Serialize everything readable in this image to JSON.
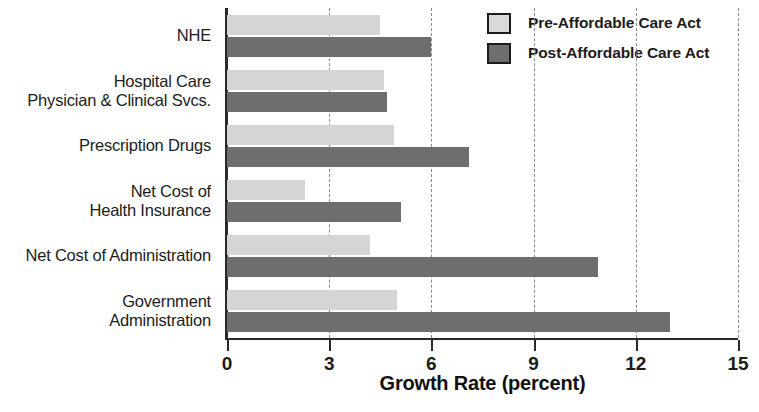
{
  "chart_data": {
    "type": "bar",
    "orientation": "horizontal",
    "title": "",
    "xlabel": "Growth Rate (percent)",
    "ylabel": "",
    "xlim": [
      0,
      15
    ],
    "xticks": [
      0,
      3,
      6,
      9,
      12,
      15
    ],
    "xticklabels": [
      "0",
      "3",
      "6",
      "9",
      "12",
      "15"
    ],
    "grid": "vertical-dashed",
    "legend_position": "top-right",
    "categories": [
      "NHE",
      "Hospital Care\nPhysician & Clinical Svcs.",
      "Prescription Drugs",
      "Net Cost of\nHealth Insurance",
      "Net Cost of Administration",
      "Government\nAdministration"
    ],
    "series": [
      {
        "name": "Pre-Affordable Care Act",
        "color": "#d5d5d5",
        "values": [
          4.5,
          4.6,
          4.9,
          2.3,
          4.2,
          5.0
        ]
      },
      {
        "name": "Post-Affordable Care Act",
        "color": "#6e6e6e",
        "values": [
          6.0,
          4.7,
          7.1,
          5.1,
          10.9,
          13.0
        ]
      }
    ]
  },
  "legend": {
    "items": [
      {
        "label": "Pre-Affordable Care Act",
        "swatch": "pre"
      },
      {
        "label": "Post-Affordable Care Act",
        "swatch": "post"
      }
    ]
  },
  "axis": {
    "x_title": "Growth Rate (percent)"
  }
}
